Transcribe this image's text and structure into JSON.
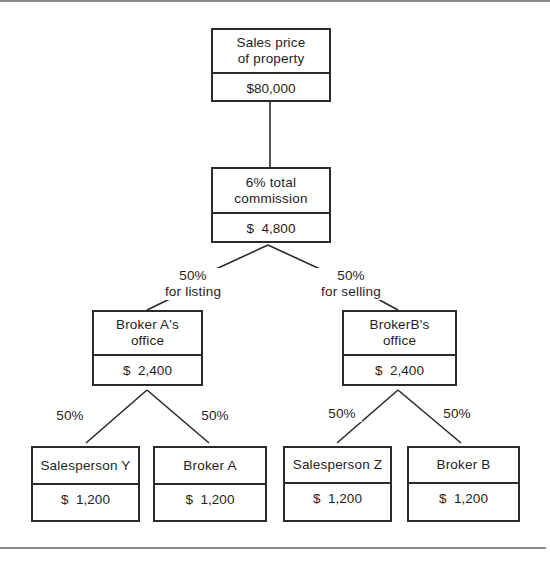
{
  "diagram": {
    "nodes": {
      "sales_price": {
        "title_line1": "Sales price",
        "title_line2": "of property",
        "amount": "$80,000"
      },
      "total_commission": {
        "title_line1": "6% total",
        "title_line2": "commission",
        "amount": "$  4,800"
      },
      "broker_a_office": {
        "title_line1": "Broker A's",
        "title_line2": "office",
        "amount": "$  2,400"
      },
      "broker_b_office": {
        "title_line1": "BrokerB's",
        "title_line2": "office",
        "amount": "$  2,400"
      },
      "salesperson_y": {
        "title": "Salesperson Y",
        "amount": "$  1,200"
      },
      "broker_a": {
        "title": "Broker A",
        "amount": "$  1,200"
      },
      "salesperson_z": {
        "title": "Salesperson Z",
        "amount": "$  1,200"
      },
      "broker_b": {
        "title": "Broker B",
        "amount": "$  1,200"
      }
    },
    "edge_labels": {
      "listing_pct": "50%",
      "listing_text": "for listing",
      "selling_pct": "50%",
      "selling_text": "for selling",
      "a_to_y": "50%",
      "a_to_broker_a": "50%",
      "b_to_z": "50%",
      "b_to_broker_b": "50%"
    },
    "colors": {
      "line": "#2a2a2a",
      "rule": "#8c8c8c",
      "background": "#ffffff"
    }
  }
}
